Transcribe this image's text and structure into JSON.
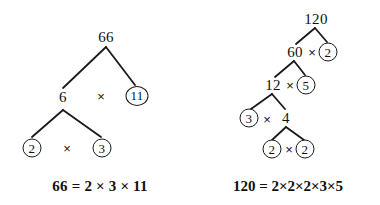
{
  "background_color": "#ffffff",
  "stroke_color": "#1a1a1a",
  "text_color": "#111111",
  "figures": [
    {
      "id": "factor-tree-66",
      "root_value": "66",
      "nodes": [
        {
          "label": "66",
          "circled": false,
          "x": 106,
          "y": 37
        },
        {
          "label": "6",
          "circled": false,
          "x": 63,
          "y": 97
        },
        {
          "label": "11",
          "circled": true,
          "x": 137,
          "y": 96
        },
        {
          "label": "2",
          "circled": true,
          "x": 32,
          "y": 148
        },
        {
          "label": "3",
          "circled": true,
          "x": 102,
          "y": 148
        }
      ],
      "operators": [
        {
          "label": "×",
          "x": 101,
          "y": 96
        },
        {
          "label": "×",
          "x": 67,
          "y": 148
        }
      ],
      "edges": [
        {
          "x1": 106,
          "y1": 47,
          "x2": 63,
          "y2": 88
        },
        {
          "x1": 106,
          "y1": 47,
          "x2": 135,
          "y2": 85
        },
        {
          "x1": 63,
          "y1": 110,
          "x2": 32,
          "y2": 137
        },
        {
          "x1": 63,
          "y1": 110,
          "x2": 101,
          "y2": 137
        }
      ],
      "equation": {
        "text": "66 = 2 × 3 × 11",
        "x": 100,
        "y": 186
      }
    },
    {
      "id": "factor-tree-120",
      "root_value": "120",
      "nodes": [
        {
          "label": "120",
          "circled": false,
          "x": 316,
          "y": 19
        },
        {
          "label": "60",
          "circled": false,
          "x": 295,
          "y": 52
        },
        {
          "label": "2",
          "circled": true,
          "x": 328,
          "y": 52
        },
        {
          "label": "12",
          "circled": false,
          "x": 273,
          "y": 85
        },
        {
          "label": "5",
          "circled": true,
          "x": 306,
          "y": 85
        },
        {
          "label": "3",
          "circled": true,
          "x": 249,
          "y": 118
        },
        {
          "label": "4",
          "circled": false,
          "x": 286,
          "y": 118
        },
        {
          "label": "2",
          "circled": true,
          "x": 272,
          "y": 149
        },
        {
          "label": "2",
          "circled": true,
          "x": 305,
          "y": 149
        }
      ],
      "operators": [
        {
          "label": "×",
          "x": 312,
          "y": 52
        },
        {
          "label": "×",
          "x": 290,
          "y": 85
        },
        {
          "label": "×",
          "x": 267,
          "y": 119
        },
        {
          "label": "×",
          "x": 289,
          "y": 149
        }
      ],
      "edges": [
        {
          "x1": 315,
          "y1": 28,
          "x2": 296,
          "y2": 44
        },
        {
          "x1": 315,
          "y1": 28,
          "x2": 327,
          "y2": 42
        },
        {
          "x1": 294,
          "y1": 61,
          "x2": 275,
          "y2": 77
        },
        {
          "x1": 294,
          "y1": 61,
          "x2": 305,
          "y2": 75
        },
        {
          "x1": 272,
          "y1": 94,
          "x2": 251,
          "y2": 109
        },
        {
          "x1": 272,
          "y1": 94,
          "x2": 285,
          "y2": 109
        },
        {
          "x1": 286,
          "y1": 127,
          "x2": 272,
          "y2": 140
        },
        {
          "x1": 286,
          "y1": 127,
          "x2": 304,
          "y2": 140
        }
      ],
      "equation": {
        "text": "120 = 2×2×2×3×5",
        "x": 288,
        "y": 186
      }
    }
  ]
}
